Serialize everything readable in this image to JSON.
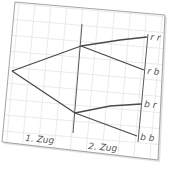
{
  "diagram": {
    "type": "tree-diagram",
    "stages": [
      {
        "label": "1. Zug"
      },
      {
        "label": "2. Zug"
      }
    ],
    "outcomes": [
      {
        "label": "r r"
      },
      {
        "label": "r b"
      },
      {
        "label": "b r"
      },
      {
        "label": "b b"
      }
    ],
    "colors": {
      "paper": "#ffffff",
      "grid": "#e4e4e4",
      "paper_border": "#9a9a9a",
      "branch": "#4a4a4a",
      "stage_line": "#555555",
      "text": "#555555",
      "shadow": "#d8d8d8"
    }
  }
}
